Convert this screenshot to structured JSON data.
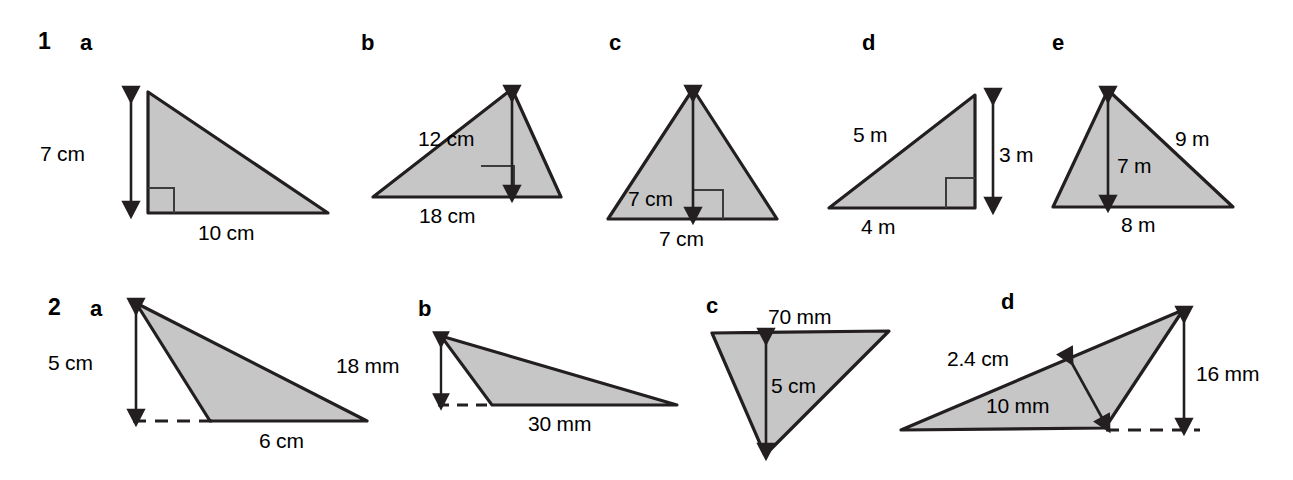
{
  "page": {
    "width": 1293,
    "height": 480,
    "background_color": "#ffffff",
    "fill_color": "#c6c6c6",
    "stroke_color": "#231f20"
  },
  "questions": [
    {
      "number": "1",
      "parts": [
        {
          "letter": "a",
          "shape": "right-triangle",
          "labels": [
            "7 cm",
            "10 cm"
          ],
          "has_right_angle_mark": true,
          "height_label": "7 cm",
          "base_label": "10 cm"
        },
        {
          "letter": "b",
          "shape": "triangle",
          "labels": [
            "12 cm",
            "18 cm"
          ],
          "has_right_angle_mark": true,
          "height_label": "12 cm",
          "base_label": "18 cm"
        },
        {
          "letter": "c",
          "shape": "triangle",
          "labels": [
            "7 cm",
            "7 cm"
          ],
          "has_right_angle_mark": true,
          "height_label": "7 cm",
          "base_label": "7 cm"
        },
        {
          "letter": "d",
          "shape": "right-triangle",
          "labels": [
            "5 m",
            "3 m",
            "4 m"
          ],
          "has_right_angle_mark": true,
          "hypotenuse_label": "5 m",
          "height_label": "3 m",
          "base_label": "4 m"
        },
        {
          "letter": "e",
          "shape": "triangle",
          "labels": [
            "9 m",
            "7 m",
            "8 m"
          ],
          "has_right_angle_mark": false,
          "side_label": "9 m",
          "height_label": "7 m",
          "base_label": "8 m"
        }
      ]
    },
    {
      "number": "2",
      "parts": [
        {
          "letter": "a",
          "shape": "obtuse-triangle",
          "labels": [
            "5 cm",
            "6 cm"
          ],
          "has_right_angle_mark": false,
          "height_label": "5 cm",
          "base_label": "6 cm"
        },
        {
          "letter": "b",
          "shape": "obtuse-triangle",
          "labels": [
            "18 mm",
            "30 mm"
          ],
          "has_right_angle_mark": false,
          "height_label": "18 mm",
          "base_label": "30 mm"
        },
        {
          "letter": "c",
          "shape": "inverted-triangle",
          "labels": [
            "70 mm",
            "5 cm"
          ],
          "has_right_angle_mark": false,
          "base_label": "70 mm",
          "height_label": "5 cm"
        },
        {
          "letter": "d",
          "shape": "obtuse-triangle",
          "labels": [
            "2.4 cm",
            "10 mm",
            "16 mm"
          ],
          "has_right_angle_mark": false,
          "side_label": "2.4 cm",
          "height_label": "10 mm",
          "vertical_label": "16 mm"
        }
      ]
    }
  ],
  "text_positions": {
    "q1_number": "1",
    "q1a_letter": "a",
    "q1b_letter": "b",
    "q1c_letter": "c",
    "q1d_letter": "d",
    "q1e_letter": "e",
    "q2_number": "2",
    "q2a_letter": "a",
    "q2b_letter": "b",
    "q2c_letter": "c",
    "q2d_letter": "d",
    "q1a_height": "7 cm",
    "q1a_base": "10 cm",
    "q1b_height": "12 cm",
    "q1b_base": "18 cm",
    "q1c_height": "7 cm",
    "q1c_base": "7 cm",
    "q1d_hyp": "5 m",
    "q1d_height": "3 m",
    "q1d_base": "4 m",
    "q1e_side": "9 m",
    "q1e_height": "7 m",
    "q1e_base": "8 m",
    "q2a_height": "5 cm",
    "q2a_base": "6 cm",
    "q2b_height": "18 mm",
    "q2b_base": "30 mm",
    "q2c_base": "70 mm",
    "q2c_height": "5 cm",
    "q2d_side": "2.4 cm",
    "q2d_height": "10 mm",
    "q2d_vertical": "16 mm"
  }
}
